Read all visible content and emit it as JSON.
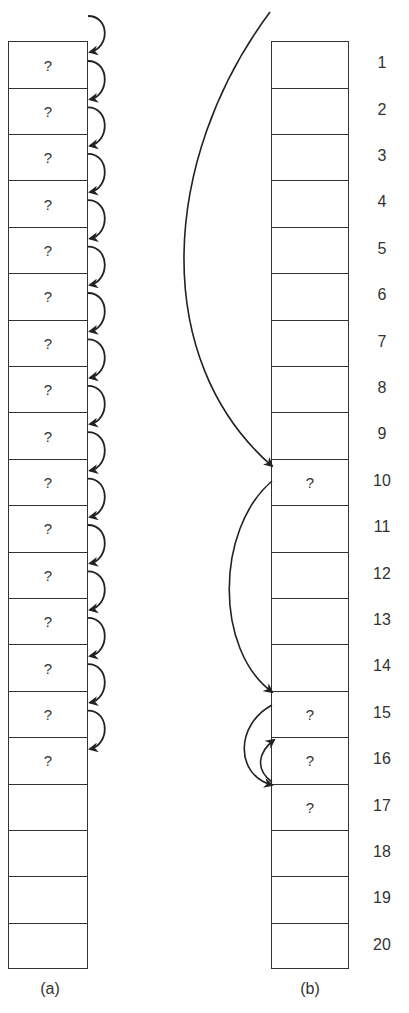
{
  "diagram": {
    "cell_count": 20,
    "panel_a": {
      "caption": "(a)",
      "cells": [
        "?",
        "?",
        "?",
        "?",
        "?",
        "?",
        "?",
        "?",
        "?",
        "?",
        "?",
        "?",
        "?",
        "?",
        "?",
        "?",
        "",
        "",
        "",
        ""
      ],
      "description": "Sequential probing: each occupied slot links to the next slot, slots 1-16 filled"
    },
    "panel_b": {
      "caption": "(b)",
      "cells": [
        "",
        "",
        "",
        "",
        "",
        "",
        "",
        "",
        "",
        "?",
        "",
        "",
        "",
        "",
        "?",
        "?",
        "?",
        "",
        "",
        ""
      ],
      "jumps": [
        {
          "from": "entry",
          "to": 10
        },
        {
          "from": 10,
          "to": 15
        },
        {
          "from": 15,
          "to": 17
        },
        {
          "from": 17,
          "to": 16
        }
      ]
    },
    "index_labels": [
      "1",
      "2",
      "3",
      "4",
      "5",
      "6",
      "7",
      "8",
      "9",
      "10",
      "11",
      "12",
      "13",
      "14",
      "15",
      "16",
      "17",
      "18",
      "19",
      "20"
    ]
  }
}
